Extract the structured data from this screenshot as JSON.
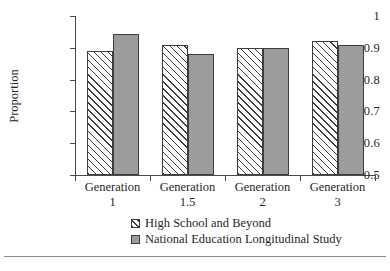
{
  "chart_data": {
    "type": "bar",
    "title": "",
    "xlabel": "",
    "ylabel": "Proportion",
    "ylim": [
      0.5,
      1
    ],
    "yticks": [
      0.5,
      0.6,
      0.7,
      0.8,
      0.9,
      1
    ],
    "ytick_labels": [
      "0.5",
      "0.6",
      "0.7",
      "0.8",
      "0.9",
      "1"
    ],
    "grid": false,
    "legend_position": "below-axis-center",
    "categories": [
      "Generation 1",
      "Generation 1.5",
      "Generation 2",
      "Generation 3"
    ],
    "category_lines": [
      {
        "line1": "Generation",
        "line2": "1"
      },
      {
        "line1": "Generation",
        "line2": "1.5"
      },
      {
        "line1": "Generation",
        "line2": "2"
      },
      {
        "line1": "Generation",
        "line2": "3"
      }
    ],
    "series": [
      {
        "name": "High School and Beyond",
        "values": [
          0.89,
          0.91,
          0.9,
          0.92
        ],
        "fill": "hatched",
        "color": "#ffffff"
      },
      {
        "name": "National Education Longitudinal Study",
        "values": [
          0.945,
          0.88,
          0.9,
          0.91
        ],
        "fill": "solid",
        "color": "#9c9c9c"
      }
    ]
  },
  "legend": {
    "items": [
      {
        "label": "High School and Beyond",
        "swatch": "hatched-swatch"
      },
      {
        "label": "National Education Longitudinal Study",
        "swatch": "gray-swatch"
      }
    ]
  },
  "colors": {
    "series_hsb": "#ffffff",
    "series_nels": "#9c9c9c",
    "axis": "#4a4a4a",
    "outline": "#3d3d3d",
    "text": "#1f1f1f",
    "rule": "#8c8c8c"
  }
}
